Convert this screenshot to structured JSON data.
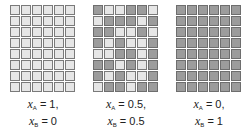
{
  "figure": {
    "colors": {
      "species_A": "#e6e6e6",
      "species_B": "#9c9c9c",
      "border": "#7a7a7a"
    },
    "panels": [
      {
        "xA_label": "= 1,",
        "xB_label": "= 0",
        "rows": [
          "LLLLLL",
          "LLLLLL",
          "LLLLLL",
          "LLLLLL",
          "LLLLLL",
          "LLLLLL",
          "LLLLLL",
          "LLLLLL"
        ]
      },
      {
        "xA_label": "= 0.5,",
        "xB_label": "= 0.5",
        "rows": [
          "DLLDDL",
          "LDDDLD",
          "DDLLDL",
          "DLDLLD",
          "LLDDLD",
          "DDLDLD",
          "DLDLLD",
          "LDDLDD"
        ]
      },
      {
        "xA_label": "= 0,",
        "xB_label": "= 1",
        "rows": [
          "DDDDDD",
          "DDDDDD",
          "DDDDDD",
          "DDDDDD",
          "DDDDDD",
          "DDDDDD",
          "DDDDDD",
          "DDDDDD"
        ]
      }
    ],
    "symbol": {
      "var": "x",
      "sub_A": "A",
      "sub_B": "B"
    }
  }
}
